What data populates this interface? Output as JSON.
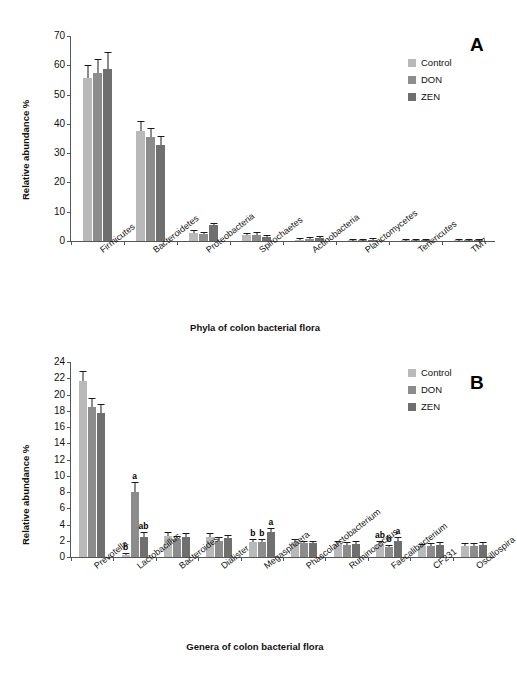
{
  "figure": {
    "panel_a_letter": "A",
    "panel_b_letter": "B"
  },
  "legend": {
    "items": [
      {
        "label": "Control",
        "color": "#b9b9b9"
      },
      {
        "label": "DON",
        "color": "#8c8c8c"
      },
      {
        "label": "ZEN",
        "color": "#6f6f6f"
      }
    ]
  },
  "chart_data": [
    {
      "type": "bar",
      "panel": "A",
      "title": "",
      "xlabel": "Phyla of colon bacterial flora",
      "ylabel": "Relative abundance %",
      "ylim": [
        0,
        70
      ],
      "yticks": [
        0,
        10,
        20,
        30,
        40,
        50,
        60,
        70
      ],
      "grid": false,
      "legend_position": "right",
      "categories": [
        "Firmicutes",
        "Bacteroidetes",
        "Proteobacteria",
        "Spirochaetes",
        "Actinobacteria",
        "Planctomycetes",
        "Tenericutes",
        "TM7"
      ],
      "series": [
        {
          "name": "Control",
          "color": "#b9b9b9",
          "values": [
            55.5,
            37.5,
            2.9,
            2.0,
            0.5,
            0.3,
            0.3,
            0.2
          ],
          "errors": [
            4.3,
            3.2,
            0.5,
            0.4,
            0.2,
            0.1,
            0.1,
            0.1
          ],
          "letters": [
            "",
            "",
            "",
            "",
            "",
            "",
            "",
            ""
          ]
        },
        {
          "name": "DON",
          "color": "#8c8c8c",
          "values": [
            57.3,
            35.5,
            2.3,
            2.2,
            0.7,
            0.4,
            0.3,
            0.2
          ],
          "errors": [
            4.5,
            2.6,
            0.4,
            0.4,
            0.2,
            0.1,
            0.1,
            0.1
          ],
          "letters": [
            "",
            "",
            "",
            "",
            "",
            "",
            "",
            ""
          ]
        },
        {
          "name": "ZEN",
          "color": "#6f6f6f",
          "values": [
            58.6,
            32.7,
            5.3,
            1.3,
            1.2,
            0.5,
            0.3,
            0.2
          ],
          "errors": [
            5.6,
            2.8,
            0.4,
            0.3,
            0.2,
            0.1,
            0.1,
            0.1
          ],
          "letters": [
            "",
            "",
            "",
            "",
            "",
            "",
            "",
            ""
          ]
        }
      ]
    },
    {
      "type": "bar",
      "panel": "B",
      "title": "",
      "xlabel": "Genera of colon bacterial flora",
      "ylabel": "Relative abundance %",
      "ylim": [
        0,
        24
      ],
      "yticks": [
        0,
        2,
        4,
        6,
        8,
        10,
        12,
        14,
        16,
        18,
        20,
        22,
        24
      ],
      "grid": false,
      "legend_position": "right",
      "categories": [
        "Prevotella",
        "Lactobacillus",
        "Bacteroides",
        "Dialister",
        "Megasphaera",
        "Phascolarctobacterium",
        "Ruminococcus",
        "Faecalibacterium",
        "CF231",
        "Oscillospira"
      ],
      "series": [
        {
          "name": "Control",
          "color": "#b9b9b9",
          "values": [
            21.7,
            0.3,
            2.6,
            2.5,
            1.8,
            1.9,
            1.6,
            1.6,
            1.3,
            1.4
          ],
          "errors": [
            1.1,
            0.1,
            0.3,
            0.3,
            0.3,
            0.2,
            0.2,
            0.2,
            0.2,
            0.2
          ],
          "letters": [
            "",
            "b",
            "",
            "",
            "b",
            "",
            "",
            "ab",
            "",
            ""
          ]
        },
        {
          "name": "DON",
          "color": "#8c8c8c",
          "values": [
            18.5,
            8.0,
            2.2,
            2.0,
            1.8,
            1.7,
            1.5,
            1.2,
            1.4,
            1.4
          ],
          "errors": [
            0.9,
            1.1,
            0.3,
            0.3,
            0.3,
            0.2,
            0.2,
            0.2,
            0.2,
            0.2
          ],
          "letters": [
            "",
            "a",
            "",
            "",
            "b",
            "",
            "",
            "b",
            "",
            ""
          ]
        },
        {
          "name": "ZEN",
          "color": "#6f6f6f",
          "values": [
            17.7,
            2.5,
            2.5,
            2.3,
            3.1,
            1.7,
            1.6,
            2.0,
            1.5,
            1.5
          ],
          "errors": [
            1.0,
            0.4,
            0.3,
            0.3,
            0.3,
            0.2,
            0.2,
            0.3,
            0.2,
            0.2
          ],
          "letters": [
            "",
            "ab",
            "",
            "",
            "a",
            "",
            "",
            "a",
            "",
            ""
          ]
        }
      ]
    }
  ]
}
